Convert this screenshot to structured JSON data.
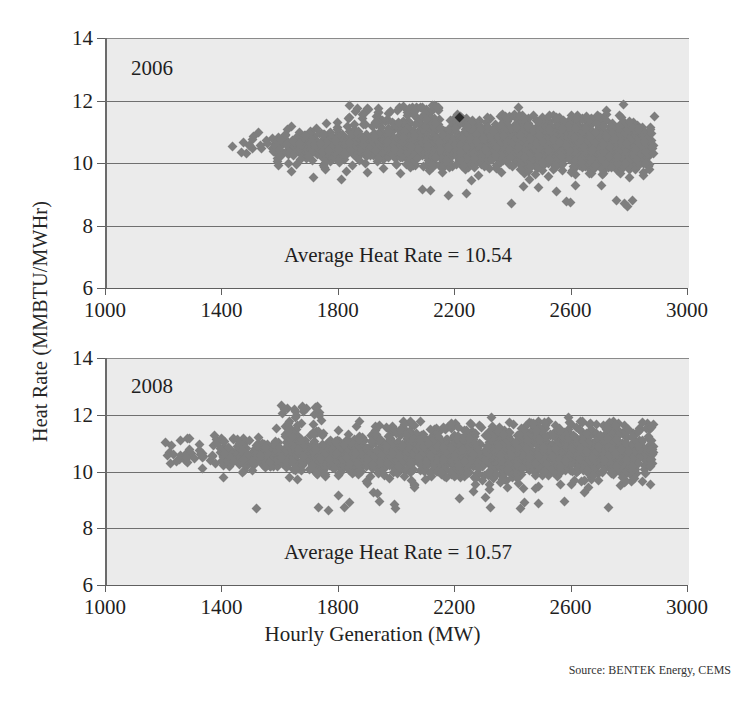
{
  "figure": {
    "xlabel": "Hourly Generation (MW)",
    "ylabel": "Heat Rate (MMBTU/MWHr)",
    "source": "Source: BENTEK Energy, CEMS"
  },
  "chart_data": {
    "type": "scatter",
    "title": "",
    "xlabel": "Hourly Generation (MW)",
    "ylabel": "Heat Rate (MMBTU/MWHr)",
    "xlim": [
      1000,
      3000
    ],
    "ylim": [
      6,
      14
    ],
    "xticks": [
      1000,
      1400,
      1800,
      2200,
      2600,
      3000
    ],
    "yticks": [
      6,
      8,
      10,
      12,
      14
    ],
    "gridlines": {
      "y": [
        8,
        10,
        12,
        14
      ],
      "x": []
    },
    "legend": "none",
    "marker": "diamond",
    "marker_color": "#7e7e7e",
    "panels": [
      {
        "name": "2006",
        "label": "2006",
        "annotation": "Average Heat Rate = 10.54",
        "average_heat_rate": 10.54,
        "x_range_observed": [
          1400,
          2880
        ],
        "y_range_observed": [
          9.2,
          11.9
        ],
        "density_note": "dense band 10.2-11.0, widening above 1800 MW",
        "highlight_point": {
          "x": 2210,
          "y": 11.45,
          "color": "#2b2b2b"
        }
      },
      {
        "name": "2008",
        "label": "2008",
        "annotation": "Average Heat Rate = 10.57",
        "average_heat_rate": 10.57,
        "x_range_observed": [
          1195,
          2880
        ],
        "y_range_observed": [
          8.9,
          12.35
        ],
        "density_note": "dense band 10.0-11.2, spike near 1650 MW reaching 12.3",
        "highlight_point": null
      }
    ]
  },
  "axes": {
    "xtick_labels": [
      "1000",
      "1400",
      "1800",
      "2200",
      "2600",
      "3000"
    ],
    "ytick_labels": [
      "6",
      "8",
      "10",
      "12",
      "14"
    ]
  }
}
